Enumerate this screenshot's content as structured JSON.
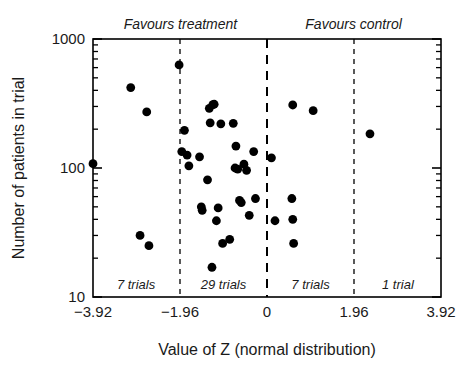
{
  "chart_data": {
    "type": "scatter",
    "title": "",
    "xlabel": "Value of Z (normal distribution)",
    "ylabel": "Number of patients in trial",
    "xlim": [
      -3.92,
      3.92
    ],
    "ylim": [
      10,
      1000
    ],
    "yscale": "log",
    "xscale": "linear",
    "grid": false,
    "legend": "none",
    "x_ticks": [
      "-3.92",
      "-1.96",
      "0",
      "1.96",
      "3.92"
    ],
    "x_tick_values": [
      -3.92,
      -1.96,
      0,
      1.96,
      3.92
    ],
    "y_ticks": [
      "10",
      "100",
      "1000"
    ],
    "y_tick_values": [
      10,
      100,
      1000
    ],
    "reference_lines": [
      {
        "x": -1.96,
        "style": "dashed",
        "emphasis": "normal"
      },
      {
        "x": 0,
        "style": "dashed",
        "emphasis": "bold"
      },
      {
        "x": 1.96,
        "style": "dashed",
        "emphasis": "normal"
      }
    ],
    "annotations": [
      {
        "text": "Favours treatment",
        "x": -1.95,
        "position": "above-axis",
        "align": "center"
      },
      {
        "text": "Favours control",
        "x": 1.95,
        "position": "above-axis",
        "align": "center"
      },
      {
        "text": "7 trials",
        "x": -2.95,
        "position": "inside-bottom",
        "align": "center"
      },
      {
        "text": "29 trials",
        "x": -0.98,
        "position": "inside-bottom",
        "align": "center"
      },
      {
        "text": "7 trials",
        "x": 0.98,
        "position": "inside-bottom",
        "align": "center"
      },
      {
        "text": "1 trial",
        "x": 2.95,
        "position": "inside-bottom",
        "align": "center"
      }
    ],
    "region_counts": [
      {
        "label": "7 trials",
        "count": 7,
        "range": [
          -3.92,
          -1.96
        ]
      },
      {
        "label": "29 trials",
        "count": 29,
        "range": [
          -1.96,
          0
        ]
      },
      {
        "label": "7 trials",
        "count": 7,
        "range": [
          0,
          1.96
        ]
      },
      {
        "label": "1 trial",
        "count": 1,
        "range": [
          1.96,
          3.92
        ]
      }
    ],
    "total_trials": 44,
    "points": [
      {
        "x": -3.92,
        "y": 108
      },
      {
        "x": -3.07,
        "y": 420
      },
      {
        "x": -2.71,
        "y": 272
      },
      {
        "x": -2.86,
        "y": 30
      },
      {
        "x": -2.66,
        "y": 25
      },
      {
        "x": -1.98,
        "y": 630
      },
      {
        "x": -1.86,
        "y": 196
      },
      {
        "x": -1.92,
        "y": 134
      },
      {
        "x": -1.8,
        "y": 126
      },
      {
        "x": -1.76,
        "y": 104
      },
      {
        "x": -1.52,
        "y": 122
      },
      {
        "x": -1.48,
        "y": 50
      },
      {
        "x": -1.46,
        "y": 47
      },
      {
        "x": -1.34,
        "y": 81
      },
      {
        "x": -1.3,
        "y": 290
      },
      {
        "x": -1.22,
        "y": 310
      },
      {
        "x": -1.19,
        "y": 312
      },
      {
        "x": -1.28,
        "y": 224
      },
      {
        "x": -1.1,
        "y": 49
      },
      {
        "x": -1.14,
        "y": 39
      },
      {
        "x": -1.04,
        "y": 220
      },
      {
        "x": -1.0,
        "y": 26
      },
      {
        "x": -0.84,
        "y": 28
      },
      {
        "x": -0.76,
        "y": 222
      },
      {
        "x": -0.7,
        "y": 148
      },
      {
        "x": -0.72,
        "y": 100
      },
      {
        "x": -0.66,
        "y": 98
      },
      {
        "x": -0.62,
        "y": 56
      },
      {
        "x": -0.58,
        "y": 54
      },
      {
        "x": -0.52,
        "y": 107
      },
      {
        "x": -0.46,
        "y": 96
      },
      {
        "x": -0.4,
        "y": 43
      },
      {
        "x": -0.3,
        "y": 134
      },
      {
        "x": -0.26,
        "y": 58
      },
      {
        "x": -1.24,
        "y": 17
      },
      {
        "x": 0.1,
        "y": 120
      },
      {
        "x": 0.18,
        "y": 39
      },
      {
        "x": 0.56,
        "y": 58
      },
      {
        "x": 0.58,
        "y": 40
      },
      {
        "x": 0.6,
        "y": 26
      },
      {
        "x": 0.58,
        "y": 308
      },
      {
        "x": 1.04,
        "y": 278
      },
      {
        "x": 2.32,
        "y": 184
      }
    ]
  }
}
